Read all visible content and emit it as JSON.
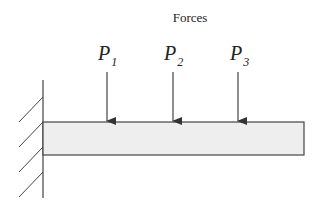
{
  "diagram": {
    "title": "Forces",
    "type": "cantilever-beam",
    "support": "fixed-wall",
    "loads": [
      {
        "label": "P",
        "subscript": "1"
      },
      {
        "label": "P",
        "subscript": "2"
      },
      {
        "label": "P",
        "subscript": "3"
      }
    ],
    "colors": {
      "line": "#333333",
      "beam_fill": "#eeeeee",
      "background": "#ffffff"
    }
  }
}
